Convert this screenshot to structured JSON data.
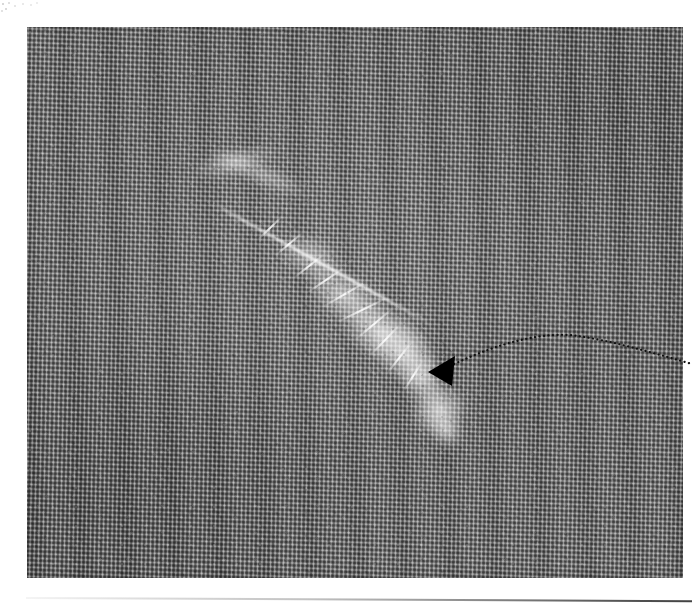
{
  "page": {
    "width": 692,
    "height": 610,
    "background_color": "#ffffff",
    "kind": "scanned-micrograph-plate"
  },
  "micrograph": {
    "name": "hrtem-lattice-micrograph",
    "x": 27,
    "y": 27,
    "width": 656,
    "height": 551,
    "modality": "HRTEM lattice-fringe image",
    "tone": {
      "mean_gray": "#8b8b8b",
      "dark_fringe": "#4a4a4a",
      "light_fringe": "#c6c6c6",
      "min_gray": "#3c3c3c",
      "max_gray": "#e8e8e8"
    },
    "lattice": {
      "row_period_px": 4.3,
      "column_period_px": 4.6,
      "row_angle_deg": 91.2,
      "column_angle_deg": 2.1,
      "appearance": "cross-hatched woven dot pattern"
    },
    "feature": {
      "name": "bright-diagonal-defect-band",
      "description": "bright jagged feathery defect running from upper-left to lower-right",
      "start_x": 200,
      "start_y": 160,
      "end_x": 465,
      "end_y": 428,
      "orientation_deg": 34
    }
  },
  "annotation": {
    "arrowhead": {
      "name": "defect-pointer-arrowhead",
      "color": "#000000",
      "tip_x": 428,
      "tip_y": 372,
      "points": "428,372 455,356 452,386",
      "direction": "points left toward the defect band"
    },
    "leader_line": {
      "name": "dotted-leader-line",
      "style": "dotted",
      "color": "#111111",
      "dot_size_px": 2.2,
      "dot_gap_px": 4.4,
      "path": "M 450,366 C 500,342 545,331 578,336 C 612,341 650,352 692,364",
      "peak_x": 575,
      "peak_y": 333,
      "exits_frame": true
    }
  },
  "scan_artifacts": {
    "top_left_specks": {
      "name": "scan-noise-specks",
      "x": 0,
      "y": 0,
      "width": 40,
      "height": 16,
      "color": "#c8c8c8"
    },
    "bottom_rule": {
      "name": "scanner-edge-line",
      "x": 26,
      "y": 597,
      "width": 666,
      "tilt_deg": 0.28,
      "color": "#3b3b3b",
      "description": "faint diagonal scanner edge line fading from left to right-dark"
    }
  }
}
